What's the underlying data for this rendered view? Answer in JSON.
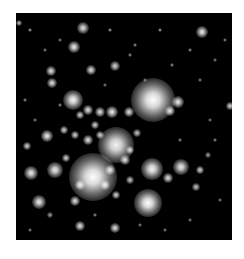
{
  "image": {
    "subject": "star cluster",
    "background_color": "#000000",
    "border_color": "#ffffff",
    "frame": {
      "x": 16,
      "y": 13,
      "width": 216,
      "height": 227
    }
  },
  "stars": [
    {
      "x": 153,
      "y": 100,
      "r": 22,
      "b": 1.0
    },
    {
      "x": 93,
      "y": 177,
      "r": 24,
      "b": 1.0
    },
    {
      "x": 116,
      "y": 145,
      "r": 18,
      "b": 0.95
    },
    {
      "x": 148,
      "y": 203,
      "r": 14,
      "b": 1.0
    },
    {
      "x": 152,
      "y": 169,
      "r": 11,
      "b": 0.95
    },
    {
      "x": 73,
      "y": 100,
      "r": 10,
      "b": 0.95
    },
    {
      "x": 83,
      "y": 28,
      "r": 6,
      "b": 0.85
    },
    {
      "x": 74,
      "y": 47,
      "r": 6,
      "b": 0.9
    },
    {
      "x": 202,
      "y": 32,
      "r": 6,
      "b": 0.9
    },
    {
      "x": 51,
      "y": 71,
      "r": 5,
      "b": 0.85
    },
    {
      "x": 52,
      "y": 83,
      "r": 5,
      "b": 0.85
    },
    {
      "x": 91,
      "y": 70,
      "r": 5,
      "b": 0.85
    },
    {
      "x": 115,
      "y": 66,
      "r": 5,
      "b": 0.8
    },
    {
      "x": 178,
      "y": 102,
      "r": 6,
      "b": 0.9
    },
    {
      "x": 129,
      "y": 112,
      "r": 5,
      "b": 0.85
    },
    {
      "x": 170,
      "y": 111,
      "r": 5,
      "b": 0.85
    },
    {
      "x": 230,
      "y": 106,
      "r": 4,
      "b": 0.8
    },
    {
      "x": 47,
      "y": 136,
      "r": 6,
      "b": 0.9
    },
    {
      "x": 31,
      "y": 173,
      "r": 7,
      "b": 0.9
    },
    {
      "x": 55,
      "y": 170,
      "r": 8,
      "b": 0.9
    },
    {
      "x": 39,
      "y": 202,
      "r": 7,
      "b": 0.9
    },
    {
      "x": 75,
      "y": 201,
      "r": 5,
      "b": 0.85
    },
    {
      "x": 80,
      "y": 226,
      "r": 5,
      "b": 0.85
    },
    {
      "x": 115,
      "y": 228,
      "r": 5,
      "b": 0.85
    },
    {
      "x": 27,
      "y": 146,
      "r": 4,
      "b": 0.8
    },
    {
      "x": 181,
      "y": 167,
      "r": 8,
      "b": 0.9
    },
    {
      "x": 168,
      "y": 178,
      "r": 5,
      "b": 0.85
    },
    {
      "x": 200,
      "y": 170,
      "r": 4,
      "b": 0.8
    },
    {
      "x": 196,
      "y": 187,
      "r": 4,
      "b": 0.75
    },
    {
      "x": 88,
      "y": 110,
      "r": 5,
      "b": 0.85
    },
    {
      "x": 100,
      "y": 112,
      "r": 5,
      "b": 0.85
    },
    {
      "x": 112,
      "y": 112,
      "r": 6,
      "b": 0.9
    },
    {
      "x": 80,
      "y": 115,
      "r": 4,
      "b": 0.8
    },
    {
      "x": 95,
      "y": 125,
      "r": 4,
      "b": 0.8
    },
    {
      "x": 75,
      "y": 135,
      "r": 4,
      "b": 0.8
    },
    {
      "x": 64,
      "y": 130,
      "r": 4,
      "b": 0.8
    },
    {
      "x": 88,
      "y": 140,
      "r": 5,
      "b": 0.85
    },
    {
      "x": 100,
      "y": 135,
      "r": 4,
      "b": 0.8
    },
    {
      "x": 130,
      "y": 150,
      "r": 4,
      "b": 0.8
    },
    {
      "x": 125,
      "y": 160,
      "r": 5,
      "b": 0.85
    },
    {
      "x": 110,
      "y": 170,
      "r": 5,
      "b": 0.85
    },
    {
      "x": 105,
      "y": 185,
      "r": 5,
      "b": 0.85
    },
    {
      "x": 80,
      "y": 185,
      "r": 5,
      "b": 0.85
    },
    {
      "x": 116,
      "y": 195,
      "r": 4,
      "b": 0.8
    },
    {
      "x": 130,
      "y": 180,
      "r": 4,
      "b": 0.75
    },
    {
      "x": 137,
      "y": 133,
      "r": 4,
      "b": 0.75
    },
    {
      "x": 66,
      "y": 158,
      "r": 4,
      "b": 0.8
    },
    {
      "x": 19,
      "y": 23,
      "r": 3,
      "b": 0.7
    },
    {
      "x": 30,
      "y": 30,
      "r": 2,
      "b": 0.6
    },
    {
      "x": 45,
      "y": 50,
      "r": 2,
      "b": 0.5
    },
    {
      "x": 110,
      "y": 30,
      "r": 2,
      "b": 0.6
    },
    {
      "x": 135,
      "y": 45,
      "r": 2,
      "b": 0.55
    },
    {
      "x": 160,
      "y": 30,
      "r": 2,
      "b": 0.6
    },
    {
      "x": 190,
      "y": 50,
      "r": 2,
      "b": 0.55
    },
    {
      "x": 215,
      "y": 60,
      "r": 2,
      "b": 0.5
    },
    {
      "x": 172,
      "y": 65,
      "r": 2,
      "b": 0.55
    },
    {
      "x": 200,
      "y": 80,
      "r": 2,
      "b": 0.5
    },
    {
      "x": 130,
      "y": 55,
      "r": 2,
      "b": 0.55
    },
    {
      "x": 60,
      "y": 40,
      "r": 2,
      "b": 0.5
    },
    {
      "x": 25,
      "y": 100,
      "r": 2,
      "b": 0.55
    },
    {
      "x": 35,
      "y": 120,
      "r": 2,
      "b": 0.5
    },
    {
      "x": 215,
      "y": 140,
      "r": 2,
      "b": 0.55
    },
    {
      "x": 220,
      "y": 200,
      "r": 2,
      "b": 0.5
    },
    {
      "x": 190,
      "y": 220,
      "r": 2,
      "b": 0.5
    },
    {
      "x": 165,
      "y": 230,
      "r": 2,
      "b": 0.5
    },
    {
      "x": 50,
      "y": 215,
      "r": 3,
      "b": 0.6
    },
    {
      "x": 30,
      "y": 230,
      "r": 2,
      "b": 0.5
    },
    {
      "x": 95,
      "y": 215,
      "r": 2,
      "b": 0.55
    },
    {
      "x": 140,
      "y": 225,
      "r": 2,
      "b": 0.5
    },
    {
      "x": 210,
      "y": 120,
      "r": 2,
      "b": 0.5
    },
    {
      "x": 225,
      "y": 40,
      "r": 2,
      "b": 0.5
    },
    {
      "x": 180,
      "y": 140,
      "r": 2,
      "b": 0.55
    },
    {
      "x": 60,
      "y": 105,
      "r": 2,
      "b": 0.55
    },
    {
      "x": 105,
      "y": 85,
      "r": 2,
      "b": 0.5
    },
    {
      "x": 145,
      "y": 80,
      "r": 2,
      "b": 0.5
    },
    {
      "x": 208,
      "y": 155,
      "r": 3,
      "b": 0.6
    }
  ]
}
